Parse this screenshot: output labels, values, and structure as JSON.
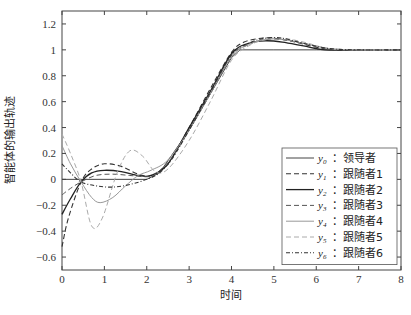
{
  "chart_data": {
    "type": "line",
    "title": "",
    "xlabel": "时间",
    "ylabel": "智能体的输出轨迹",
    "xlim": [
      0,
      8
    ],
    "ylim": [
      -0.7,
      1.3
    ],
    "xticks": [
      0,
      1,
      2,
      3,
      4,
      5,
      6,
      7,
      8
    ],
    "yticks": [
      -0.6,
      -0.4,
      -0.2,
      0,
      0.2,
      0.4,
      0.6,
      0.8,
      1,
      1.2
    ],
    "ytick_labels": [
      "−0.6",
      "−0.4",
      "−0.2",
      "0",
      "0.2",
      "0.4",
      "0.6",
      "0.8",
      "1",
      "1.2"
    ],
    "grid": false,
    "legend_position": "lower right (inside)",
    "series": [
      {
        "name": "y0: 领导者",
        "sym": "y",
        "sub": "0",
        "label": "：领导者",
        "style": "solid",
        "color": "#444444",
        "width": 1.0,
        "x": [
          0,
          2,
          2.3,
          3,
          3.5,
          4,
          4.2,
          5,
          6,
          7,
          8
        ],
        "y": [
          0,
          0,
          0.05,
          0.38,
          0.66,
          0.94,
          1.0,
          1.0,
          1.0,
          1.0,
          1.0
        ]
      },
      {
        "name": "y1: 跟随者1",
        "sym": "y",
        "sub": "1",
        "label": "：跟随者1",
        "style": "dashed",
        "color": "#333333",
        "width": 1.1,
        "x": [
          0,
          0.15,
          0.45,
          0.7,
          1.0,
          1.4,
          1.8,
          2.1,
          2.5,
          3,
          3.5,
          4,
          4.3,
          4.7,
          5,
          5.5,
          6,
          6.5,
          7,
          8
        ],
        "y": [
          -0.52,
          -0.3,
          -0.02,
          0.08,
          0.12,
          0.1,
          0.04,
          0.03,
          0.12,
          0.4,
          0.7,
          0.98,
          1.06,
          1.09,
          1.09,
          1.06,
          1.02,
          1.0,
          1.0,
          1.0
        ]
      },
      {
        "name": "y2: 跟随者2",
        "sym": "y",
        "sub": "2",
        "label": "：跟随者2",
        "style": "solid",
        "color": "#222222",
        "width": 1.3,
        "x": [
          0,
          0.2,
          0.45,
          0.7,
          1.0,
          1.4,
          1.8,
          2.1,
          2.5,
          3,
          3.5,
          4,
          4.4,
          4.8,
          5.2,
          5.7,
          6.2,
          7,
          8
        ],
        "y": [
          -0.27,
          -0.15,
          -0.02,
          0.05,
          0.07,
          0.06,
          0.03,
          0.03,
          0.12,
          0.4,
          0.68,
          0.97,
          1.05,
          1.07,
          1.06,
          1.03,
          1.0,
          1.0,
          1.0
        ]
      },
      {
        "name": "y3: 跟随者3",
        "sym": "y",
        "sub": "3",
        "label": "：跟随者3",
        "style": "dashed",
        "color": "#555555",
        "width": 1.0,
        "x": [
          0,
          0.2,
          0.45,
          0.8,
          1.2,
          1.6,
          2.0,
          2.2,
          2.6,
          3,
          3.5,
          4,
          4.4,
          4.8,
          5.2,
          5.7,
          6.3,
          7,
          8
        ],
        "y": [
          -0.12,
          -0.07,
          -0.02,
          0.03,
          0.04,
          0.03,
          0.02,
          0.04,
          0.17,
          0.38,
          0.66,
          0.95,
          1.04,
          1.08,
          1.08,
          1.05,
          1.01,
          1.0,
          1.0
        ]
      },
      {
        "name": "y4: 跟随者4",
        "sym": "y",
        "sub": "4",
        "label": "：跟随者4",
        "style": "solid",
        "color": "#999999",
        "width": 1.0,
        "x": [
          0,
          0.2,
          0.45,
          0.7,
          0.9,
          1.2,
          1.5,
          1.8,
          2.1,
          2.5,
          3,
          3.5,
          4,
          4.4,
          4.8,
          5.2,
          5.7,
          6.3,
          7,
          8
        ],
        "y": [
          0.26,
          0.12,
          -0.02,
          -0.14,
          -0.18,
          -0.14,
          -0.05,
          0.03,
          0.07,
          0.15,
          0.38,
          0.66,
          0.95,
          1.04,
          1.08,
          1.08,
          1.05,
          1.01,
          1.0,
          1.0
        ]
      },
      {
        "name": "y5: 跟随者5",
        "sym": "y",
        "sub": "5",
        "label": "：跟随者5",
        "style": "dashed",
        "color": "#aaaaaa",
        "width": 1.0,
        "x": [
          0,
          0.2,
          0.45,
          0.7,
          0.95,
          1.3,
          1.6,
          1.9,
          2.2,
          2.5,
          3,
          3.5,
          4,
          4.4,
          4.8,
          5.2,
          5.7,
          6.3,
          7,
          8
        ],
        "y": [
          0.35,
          0.2,
          -0.02,
          -0.36,
          -0.3,
          0.05,
          0.22,
          0.18,
          0.06,
          0.08,
          0.3,
          0.6,
          0.92,
          1.03,
          1.08,
          1.09,
          1.06,
          1.01,
          1.0,
          1.0
        ]
      },
      {
        "name": "y6: 跟随者6",
        "sym": "y",
        "sub": "6",
        "label": "：跟随者6",
        "style": "dashdot",
        "color": "#333333",
        "width": 1.1,
        "x": [
          0,
          0.2,
          0.45,
          0.8,
          1.2,
          1.6,
          2.0,
          2.3,
          2.6,
          3,
          3.5,
          4,
          4.4,
          4.8,
          5.2,
          5.7,
          6.3,
          7,
          8
        ],
        "y": [
          0.12,
          0.05,
          -0.02,
          -0.05,
          -0.06,
          -0.04,
          0.0,
          0.05,
          0.16,
          0.38,
          0.67,
          0.96,
          1.05,
          1.09,
          1.09,
          1.05,
          1.01,
          1.0,
          1.0
        ]
      }
    ]
  },
  "plot_box": {
    "left": 62,
    "top": 11,
    "right": 401,
    "bottom": 270
  }
}
